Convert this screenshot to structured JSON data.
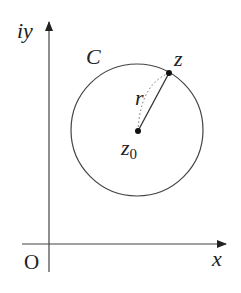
{
  "diagram": {
    "axes": {
      "y_label": "iy",
      "x_label": "x",
      "origin_label": "O"
    },
    "circle": {
      "label": "C",
      "center_label": "z",
      "center_subscript": "0",
      "point_label": "z",
      "radius_label": "r"
    },
    "colors": {
      "stroke": "#333333",
      "background": "#ffffff"
    }
  }
}
